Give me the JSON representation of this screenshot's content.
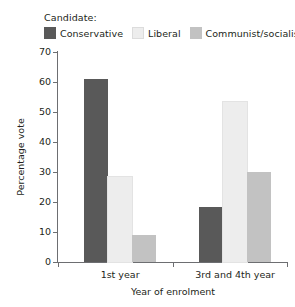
{
  "legend": {
    "title": "Candidate:",
    "entries": [
      {
        "label": "Conservative",
        "color": "#595959"
      },
      {
        "label": "Liberal",
        "color": "#ededed"
      },
      {
        "label": "Communist/socialist",
        "color": "#c2c2c2"
      }
    ]
  },
  "axes": {
    "y_title": "Percentage vote",
    "x_title": "Year of enrolment",
    "y_ticks": [
      "0",
      "10",
      "20",
      "30",
      "40",
      "50",
      "60",
      "70"
    ]
  },
  "chart_data": {
    "type": "bar",
    "title": "",
    "xlabel": "Year of enrolment",
    "ylabel": "Percentage vote",
    "ylim": [
      0,
      70
    ],
    "ytick_values": [
      0,
      10,
      20,
      30,
      40,
      50,
      60,
      70
    ],
    "grid": false,
    "legend_position": "top-left",
    "legend_title": "Candidate:",
    "categories": [
      "1st year",
      "3rd and 4th year"
    ],
    "series": [
      {
        "name": "Conservative",
        "color": "#595959",
        "values": [
          61,
          18.5
        ]
      },
      {
        "name": "Liberal",
        "color": "#ededed",
        "values": [
          28.5,
          53.5
        ]
      },
      {
        "name": "Communist/socialist",
        "color": "#c2c2c2",
        "values": [
          9,
          30
        ]
      }
    ]
  }
}
